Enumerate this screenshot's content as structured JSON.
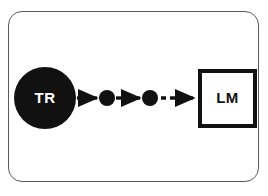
{
  "figure": {
    "name": "transcription-to-language-model-flow",
    "background_color": "#ffffff",
    "frame": {
      "name": "rounded-panel-border",
      "border_color": "#5a5a5c",
      "corner_radius": 14
    },
    "nodes": [
      {
        "id": "tr",
        "shape": "circle",
        "label": "TR",
        "fill": "#111111",
        "text_color": "#ffffff",
        "cx": 45,
        "cy": 98,
        "r": 31
      },
      {
        "id": "dot1",
        "shape": "circle",
        "label": "",
        "fill": "#111111",
        "text_color": "#ffffff",
        "cx": 107,
        "cy": 98,
        "r": 8
      },
      {
        "id": "dot2",
        "shape": "circle",
        "label": "",
        "fill": "#111111",
        "text_color": "#ffffff",
        "cx": 150,
        "cy": 98,
        "r": 8
      },
      {
        "id": "lm",
        "shape": "square",
        "label": "LM",
        "fill": "#ffffff",
        "text_color": "#111111",
        "stroke": "#111111",
        "stroke_width": 4,
        "x": 198,
        "y": 69,
        "width": 59,
        "height": 59
      }
    ],
    "edges": [
      {
        "id": "edge-tr-dot1",
        "from": "tr",
        "to": "dot1",
        "style": "solid",
        "color": "#111111",
        "x1": 77,
        "x2": 98,
        "y": 98
      },
      {
        "id": "edge-dot1-dot2",
        "from": "dot1",
        "to": "dot2",
        "style": "solid",
        "color": "#111111",
        "x1": 116,
        "x2": 141,
        "y": 98
      },
      {
        "id": "edge-dot2-lm",
        "from": "dot2",
        "to": "lm",
        "style": "dashed",
        "color": "#111111",
        "x1": 160,
        "x2": 195,
        "y": 98,
        "dash_pattern": "5 4"
      }
    ]
  }
}
